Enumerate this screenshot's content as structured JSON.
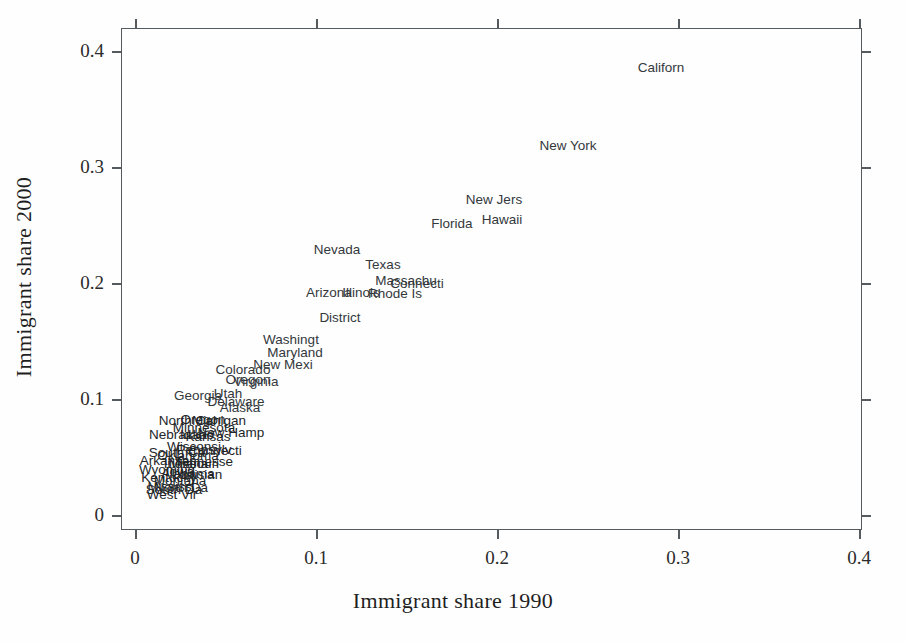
{
  "figure": {
    "background_color": "#fefefe",
    "axis_color": "#555a5e",
    "label_color": "#33383c"
  },
  "axes": {
    "x_title": "Immigrant share 1990",
    "y_title": "Immigrant share 2000",
    "x_ticks": [
      "0",
      "0.1",
      "0.2",
      "0.3",
      "0.4"
    ],
    "y_ticks": [
      "0",
      "0.1",
      "0.2",
      "0.3",
      "0.4"
    ]
  },
  "chart_data": {
    "type": "scatter",
    "title": "",
    "xlabel": "Immigrant share 1990",
    "ylabel": "Immigrant share 2000",
    "xlim": [
      0,
      0.4
    ],
    "ylim": [
      0,
      0.4
    ],
    "grid": false,
    "legend": "none",
    "point_marker": "text-label",
    "note": "Each observation is rendered as a truncated state-name text label rather than a marker glyph.",
    "points": [
      {
        "label": "Californ",
        "x": 0.2755,
        "y": 0.3865
      },
      {
        "label": "New York",
        "x": 0.2385,
        "y": 0.3185
      },
      {
        "label": "New Jers",
        "x": 0.1855,
        "y": 0.2635
      },
      {
        "label": "Hawaii",
        "x": 0.1775,
        "y": 0.246
      },
      {
        "label": "Florida",
        "x": 0.161,
        "y": 0.242
      },
      {
        "label": "Nevada",
        "x": 0.115,
        "y": 0.219
      },
      {
        "label": "Texas",
        "x": 0.138,
        "y": 0.207
      },
      {
        "label": "Massachu",
        "x": 0.15,
        "y": 0.196
      },
      {
        "label": "Connecti",
        "x": 0.156,
        "y": 0.1945
      },
      {
        "label": "Illinois",
        "x": 0.1305,
        "y": 0.19
      },
      {
        "label": "Rhode Is",
        "x": 0.1445,
        "y": 0.189
      },
      {
        "label": "Arizona",
        "x": 0.1075,
        "y": 0.1905
      },
      {
        "label": "District",
        "x": 0.114,
        "y": 0.1715
      },
      {
        "label": "Washingt",
        "x": 0.0925,
        "y": 0.1465
      },
      {
        "label": "Maryland",
        "x": 0.0955,
        "y": 0.137
      },
      {
        "label": "New Mexi",
        "x": 0.087,
        "y": 0.1275
      },
      {
        "label": "Colorado",
        "x": 0.062,
        "y": 0.123
      },
      {
        "label": "Oregon",
        "x": 0.0655,
        "y": 0.116
      },
      {
        "label": "Virginia",
        "x": 0.072,
        "y": 0.1135
      },
      {
        "label": "Georgia",
        "x": 0.04,
        "y": 0.1
      },
      {
        "label": "Utah",
        "x": 0.0555,
        "y": 0.1015
      },
      {
        "label": "Delaware",
        "x": 0.059,
        "y": 0.0955
      },
      {
        "label": "Alaska",
        "x": 0.062,
        "y": 0.0915
      },
      {
        "label": "North Car",
        "x": 0.03,
        "y": 0.082
      },
      {
        "label": "Oregon2",
        "x": 0.0395,
        "y": 0.0825
      },
      {
        "label": "Michigan",
        "x": 0.048,
        "y": 0.082
      },
      {
        "label": "Minnesota",
        "x": 0.04,
        "y": 0.0765
      },
      {
        "label": "New Hamp",
        "x": 0.0545,
        "y": 0.074
      },
      {
        "label": "Nebraska",
        "x": 0.025,
        "y": 0.0725
      },
      {
        "label": "Idaho",
        "x": 0.0355,
        "y": 0.072
      },
      {
        "label": "Kansas",
        "x": 0.0415,
        "y": 0.0705
      },
      {
        "label": "Wisconsi",
        "x": 0.034,
        "y": 0.064
      },
      {
        "label": "Pennsylv",
        "x": 0.0395,
        "y": 0.062
      },
      {
        "label": "Connect2",
        "x": 0.0455,
        "y": 0.0615
      },
      {
        "label": "South Ca",
        "x": 0.0245,
        "y": 0.06
      },
      {
        "label": "Oklahoma",
        "x": 0.0305,
        "y": 0.0575
      },
      {
        "label": "Arkansas",
        "x": 0.02,
        "y": 0.054
      },
      {
        "label": "Tennesse",
        "x": 0.04,
        "y": 0.0535
      },
      {
        "label": "Indiana",
        "x": 0.029,
        "y": 0.052
      },
      {
        "label": "Missouri",
        "x": 0.034,
        "y": 0.052
      },
      {
        "label": "Wyoming",
        "x": 0.0195,
        "y": 0.047
      },
      {
        "label": "Iowa",
        "x": 0.0265,
        "y": 0.0455
      },
      {
        "label": "Alabama",
        "x": 0.031,
        "y": 0.0445
      },
      {
        "label": "Louisian",
        "x": 0.036,
        "y": 0.044
      },
      {
        "label": "Kentucky",
        "x": 0.0205,
        "y": 0.042
      },
      {
        "label": "Montana",
        "x": 0.0265,
        "y": 0.04
      },
      {
        "label": "Mississi",
        "x": 0.0215,
        "y": 0.0355
      },
      {
        "label": "North Da",
        "x": 0.0275,
        "y": 0.035
      },
      {
        "label": "South Da",
        "x": 0.0235,
        "y": 0.033
      },
      {
        "label": "West Vir",
        "x": 0.0225,
        "y": 0.03
      }
    ]
  },
  "labels": [
    {
      "name": "californ",
      "text": "Californ",
      "left": 661,
      "top": 68
    },
    {
      "name": "new-york",
      "text": "New York",
      "left": 568,
      "top": 146
    },
    {
      "name": "new-jers",
      "text": "New Jers",
      "left": 494,
      "top": 200
    },
    {
      "name": "hawaii",
      "text": "Hawaii",
      "left": 502,
      "top": 220
    },
    {
      "name": "florida",
      "text": "Florida",
      "left": 452,
      "top": 224
    },
    {
      "name": "nevada",
      "text": "Nevada",
      "left": 337,
      "top": 250
    },
    {
      "name": "texas",
      "text": "Texas",
      "left": 383,
      "top": 265
    },
    {
      "name": "massachu",
      "text": "Massachu",
      "left": 406,
      "top": 281
    },
    {
      "name": "connecti",
      "text": "Connecti",
      "left": 417,
      "top": 284
    },
    {
      "name": "illinois",
      "text": "Illinois",
      "left": 361,
      "top": 293
    },
    {
      "name": "rhode-is",
      "text": "Rhode Is",
      "left": 395,
      "top": 294
    },
    {
      "name": "arizona",
      "text": "Arizona",
      "left": 329,
      "top": 293
    },
    {
      "name": "district",
      "text": "District",
      "left": 340,
      "top": 318
    },
    {
      "name": "washingt",
      "text": "Washingt",
      "left": 291,
      "top": 340
    },
    {
      "name": "maryland",
      "text": "Maryland",
      "left": 295,
      "top": 353
    },
    {
      "name": "new-mexi",
      "text": "New Mexi",
      "left": 283,
      "top": 365
    },
    {
      "name": "colorado",
      "text": "Colorado",
      "left": 243,
      "top": 370
    },
    {
      "name": "oregon",
      "text": "Oregon",
      "left": 248,
      "top": 380
    },
    {
      "name": "virginia",
      "text": "Virginia",
      "left": 256,
      "top": 382
    },
    {
      "name": "georgia",
      "text": "Georgia",
      "left": 198,
      "top": 396
    },
    {
      "name": "utah",
      "text": "Utah",
      "left": 228,
      "top": 394
    },
    {
      "name": "delaware",
      "text": "Delaware",
      "left": 236,
      "top": 402
    },
    {
      "name": "alaska",
      "text": "Alaska",
      "left": 240,
      "top": 408
    },
    {
      "name": "north-car",
      "text": "North Car",
      "left": 188,
      "top": 421
    },
    {
      "name": "oregon-2",
      "text": "Oregon",
      "left": 203,
      "top": 420
    },
    {
      "name": "michigan",
      "text": "Michigan",
      "left": 219,
      "top": 421
    },
    {
      "name": "minnesota",
      "text": "Minnesota",
      "left": 204,
      "top": 428
    },
    {
      "name": "new-hamp",
      "text": "New Hamp",
      "left": 231,
      "top": 433
    },
    {
      "name": "nebraska",
      "text": "Nebraska",
      "left": 178,
      "top": 435
    },
    {
      "name": "idaho",
      "text": "Idaho",
      "left": 197,
      "top": 435
    },
    {
      "name": "kansas",
      "text": "Kansas",
      "left": 208,
      "top": 437
    },
    {
      "name": "wisconsi",
      "text": "Wisconsi",
      "left": 194,
      "top": 447
    },
    {
      "name": "pennsylv",
      "text": "Pennsylv",
      "left": 204,
      "top": 450
    },
    {
      "name": "connect-2",
      "text": "Connecti",
      "left": 215,
      "top": 451
    },
    {
      "name": "south-ca",
      "text": "South Ca",
      "left": 177,
      "top": 453
    },
    {
      "name": "oklahoma",
      "text": "Oklahoma",
      "left": 188,
      "top": 456
    },
    {
      "name": "arkansas",
      "text": "Arkansas",
      "left": 168,
      "top": 461
    },
    {
      "name": "tennesse",
      "text": "Tennesse",
      "left": 204,
      "top": 462
    },
    {
      "name": "indiana",
      "text": "Indiana",
      "left": 186,
      "top": 464
    },
    {
      "name": "missouri",
      "text": "Missouri",
      "left": 194,
      "top": 464
    },
    {
      "name": "wyoming",
      "text": "Wyoming",
      "left": 167,
      "top": 470
    },
    {
      "name": "iowa",
      "text": "Iowa",
      "left": 180,
      "top": 472
    },
    {
      "name": "alabama",
      "text": "Alabama",
      "left": 188,
      "top": 474
    },
    {
      "name": "louisian",
      "text": "Louisian",
      "left": 197,
      "top": 475
    },
    {
      "name": "kentucky",
      "text": "Kentucky",
      "left": 169,
      "top": 478
    },
    {
      "name": "montana",
      "text": "Montana",
      "left": 180,
      "top": 481
    },
    {
      "name": "mississi",
      "text": "Mississi",
      "left": 171,
      "top": 487
    },
    {
      "name": "north-da",
      "text": "North Da",
      "left": 181,
      "top": 488
    },
    {
      "name": "south-da",
      "text": "South Da",
      "left": 174,
      "top": 490
    },
    {
      "name": "west-vir",
      "text": "West Vir",
      "left": 172,
      "top": 495
    }
  ],
  "geometry": {
    "plot_left": 121,
    "plot_top": 28,
    "plot_width": 741,
    "plot_height": 502,
    "x_tick_px": [
      135,
      316,
      497,
      678,
      859
    ],
    "y_tick_px": [
      515,
      399,
      283,
      167,
      51
    ]
  }
}
